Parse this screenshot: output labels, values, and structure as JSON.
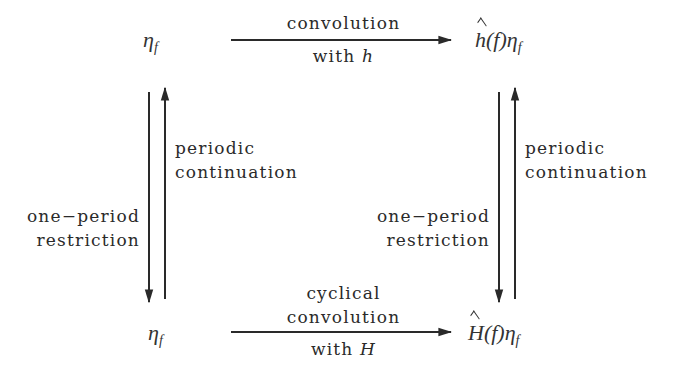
{
  "nodes": {
    "top_left": {
      "base": "η",
      "sub": "f"
    },
    "top_right": {
      "hat": "h",
      "arg": "(f)",
      "base": "η",
      "sub": "f"
    },
    "bottom_left": {
      "base": "η",
      "sub": "f"
    },
    "bottom_right": {
      "hat": "H",
      "arg": "(f)",
      "base": "η",
      "sub": "f"
    }
  },
  "edges": {
    "top": {
      "line1": "convolution",
      "line2_text": "with ",
      "line2_var": "h"
    },
    "bottom": {
      "line1": "cyclical",
      "line2": "convolution",
      "line3_text": "with ",
      "line3_var": "H"
    },
    "left_down": {
      "line1": "one−period",
      "line2": "restriction"
    },
    "left_up": {
      "line1": "periodic",
      "line2": "continuation"
    },
    "right_down": {
      "line1": "one−period",
      "line2": "restriction"
    },
    "right_up": {
      "line1": "periodic",
      "line2": "continuation"
    }
  },
  "colors": {
    "ink": "#2a2a2a",
    "background": "#ffffff"
  }
}
